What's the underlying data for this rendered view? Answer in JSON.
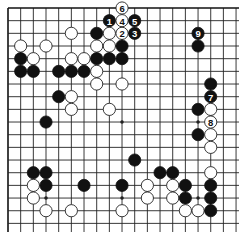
{
  "diagram": {
    "type": "go-board",
    "board_size": 19,
    "visible_rows": 18,
    "edges_shown": [
      "top",
      "left"
    ],
    "colors": {
      "black": "#111111",
      "white": "#ffffff",
      "line": "#222222",
      "background": "#ffffff"
    },
    "star_points": [
      [
        3,
        9
      ],
      [
        9,
        9
      ],
      [
        9,
        15
      ],
      [
        15,
        3
      ],
      [
        15,
        9
      ],
      [
        15,
        15
      ],
      [
        3,
        3
      ],
      [
        3,
        15
      ]
    ],
    "stones": [
      {
        "color": "white",
        "row": 0,
        "col": 9,
        "label": "6"
      },
      {
        "color": "black",
        "row": 1,
        "col": 8,
        "label": "1"
      },
      {
        "color": "white",
        "row": 1,
        "col": 9,
        "label": "4"
      },
      {
        "color": "black",
        "row": 1,
        "col": 10,
        "label": "5"
      },
      {
        "color": "white",
        "row": 2,
        "col": 5,
        "label": ""
      },
      {
        "color": "black",
        "row": 2,
        "col": 7,
        "label": ""
      },
      {
        "color": "white",
        "row": 2,
        "col": 8,
        "label": ""
      },
      {
        "color": "white",
        "row": 2,
        "col": 9,
        "label": "2"
      },
      {
        "color": "black",
        "row": 2,
        "col": 10,
        "label": "3"
      },
      {
        "color": "black",
        "row": 2,
        "col": 15,
        "label": "9"
      },
      {
        "color": "white",
        "row": 3,
        "col": 1,
        "label": ""
      },
      {
        "color": "white",
        "row": 3,
        "col": 3,
        "label": ""
      },
      {
        "color": "white",
        "row": 3,
        "col": 7,
        "label": ""
      },
      {
        "color": "white",
        "row": 3,
        "col": 8,
        "label": ""
      },
      {
        "color": "black",
        "row": 3,
        "col": 9,
        "label": ""
      },
      {
        "color": "black",
        "row": 3,
        "col": 15,
        "label": ""
      },
      {
        "color": "black",
        "row": 4,
        "col": 1,
        "label": ""
      },
      {
        "color": "white",
        "row": 4,
        "col": 2,
        "label": ""
      },
      {
        "color": "white",
        "row": 4,
        "col": 5,
        "label": ""
      },
      {
        "color": "white",
        "row": 4,
        "col": 6,
        "label": ""
      },
      {
        "color": "black",
        "row": 4,
        "col": 7,
        "label": ""
      },
      {
        "color": "black",
        "row": 4,
        "col": 8,
        "label": ""
      },
      {
        "color": "black",
        "row": 4,
        "col": 9,
        "label": ""
      },
      {
        "color": "black",
        "row": 5,
        "col": 1,
        "label": ""
      },
      {
        "color": "black",
        "row": 5,
        "col": 2,
        "label": ""
      },
      {
        "color": "black",
        "row": 5,
        "col": 4,
        "label": ""
      },
      {
        "color": "black",
        "row": 5,
        "col": 5,
        "label": ""
      },
      {
        "color": "black",
        "row": 5,
        "col": 6,
        "label": ""
      },
      {
        "color": "white",
        "row": 5,
        "col": 7,
        "label": ""
      },
      {
        "color": "white",
        "row": 6,
        "col": 7,
        "label": ""
      },
      {
        "color": "white",
        "row": 6,
        "col": 9,
        "label": ""
      },
      {
        "color": "black",
        "row": 6,
        "col": 16,
        "label": ""
      },
      {
        "color": "black",
        "row": 7,
        "col": 4,
        "label": ""
      },
      {
        "color": "white",
        "row": 7,
        "col": 5,
        "label": ""
      },
      {
        "color": "black",
        "row": 7,
        "col": 16,
        "label": "7"
      },
      {
        "color": "white",
        "row": 8,
        "col": 5,
        "label": ""
      },
      {
        "color": "white",
        "row": 8,
        "col": 8,
        "label": ""
      },
      {
        "color": "black",
        "row": 8,
        "col": 15,
        "label": ""
      },
      {
        "color": "white",
        "row": 8,
        "col": 16,
        "label": ""
      },
      {
        "color": "black",
        "row": 9,
        "col": 3,
        "label": ""
      },
      {
        "color": "white",
        "row": 9,
        "col": 16,
        "label": "8"
      },
      {
        "color": "black",
        "row": 10,
        "col": 15,
        "label": ""
      },
      {
        "color": "white",
        "row": 10,
        "col": 16,
        "label": ""
      },
      {
        "color": "white",
        "row": 11,
        "col": 16,
        "label": ""
      },
      {
        "color": "black",
        "row": 12,
        "col": 10,
        "label": ""
      },
      {
        "color": "black",
        "row": 13,
        "col": 2,
        "label": ""
      },
      {
        "color": "black",
        "row": 13,
        "col": 3,
        "label": ""
      },
      {
        "color": "black",
        "row": 13,
        "col": 12,
        "label": ""
      },
      {
        "color": "black",
        "row": 13,
        "col": 13,
        "label": ""
      },
      {
        "color": "white",
        "row": 13,
        "col": 16,
        "label": ""
      },
      {
        "color": "white",
        "row": 14,
        "col": 2,
        "label": ""
      },
      {
        "color": "black",
        "row": 14,
        "col": 3,
        "label": ""
      },
      {
        "color": "black",
        "row": 14,
        "col": 6,
        "label": ""
      },
      {
        "color": "black",
        "row": 14,
        "col": 9,
        "label": ""
      },
      {
        "color": "white",
        "row": 14,
        "col": 11,
        "label": ""
      },
      {
        "color": "white",
        "row": 14,
        "col": 13,
        "label": ""
      },
      {
        "color": "black",
        "row": 14,
        "col": 14,
        "label": ""
      },
      {
        "color": "black",
        "row": 14,
        "col": 16,
        "label": ""
      },
      {
        "color": "white",
        "row": 15,
        "col": 2,
        "label": ""
      },
      {
        "color": "white",
        "row": 15,
        "col": 11,
        "label": ""
      },
      {
        "color": "white",
        "row": 15,
        "col": 13,
        "label": ""
      },
      {
        "color": "black",
        "row": 15,
        "col": 14,
        "label": ""
      },
      {
        "color": "black",
        "row": 15,
        "col": 16,
        "label": ""
      },
      {
        "color": "white",
        "row": 16,
        "col": 3,
        "label": ""
      },
      {
        "color": "white",
        "row": 16,
        "col": 5,
        "label": ""
      },
      {
        "color": "white",
        "row": 16,
        "col": 9,
        "label": ""
      },
      {
        "color": "white",
        "row": 16,
        "col": 14,
        "label": ""
      },
      {
        "color": "white",
        "row": 16,
        "col": 15,
        "label": ""
      },
      {
        "color": "black",
        "row": 16,
        "col": 16,
        "label": ""
      }
    ]
  }
}
